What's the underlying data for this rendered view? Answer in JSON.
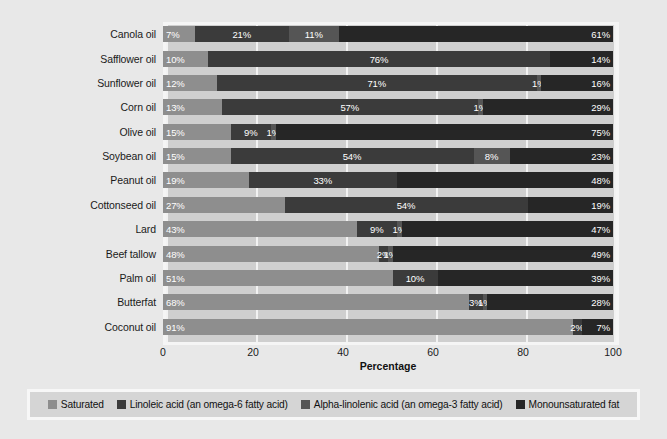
{
  "chart_data": {
    "type": "bar",
    "orientation": "horizontal",
    "stacked": true,
    "title": "",
    "xlabel": "Percentage",
    "ylabel": "",
    "xlim": [
      0,
      100
    ],
    "xticks": [
      0,
      20,
      40,
      60,
      80,
      100
    ],
    "xtick_labels": [
      "0",
      "20",
      "40",
      "60",
      "80",
      "100"
    ],
    "grid": true,
    "legend_position": "bottom",
    "categories": [
      "Canola oil",
      "Safflower oil",
      "Sunflower oil",
      "Corn oil",
      "Olive oil",
      "Soybean oil",
      "Peanut oil",
      "Cottonseed oil",
      "Lard",
      "Beef tallow",
      "Palm oil",
      "Butterfat",
      "Coconut oil"
    ],
    "series": [
      {
        "name": "Saturated",
        "color": "#8e8e8e",
        "values": [
          7,
          10,
          12,
          13,
          15,
          15,
          19,
          27,
          43,
          48,
          51,
          68,
          91
        ],
        "labels": [
          "7%",
          "10%",
          "12%",
          "13%",
          "15%",
          "15%",
          "19%",
          "27%",
          "43%",
          "48%",
          "51%",
          "68%",
          "91%"
        ]
      },
      {
        "name": "Linoleic acid (an omega-6 fatty acid)",
        "color": "#3b3b3b",
        "values": [
          21,
          76,
          71,
          57,
          9,
          54,
          33,
          54,
          9,
          2,
          10,
          3,
          2
        ],
        "labels": [
          "21%",
          "76%",
          "71%",
          "57%",
          "9%",
          "54%",
          "33%",
          "54%",
          "9%",
          "2%",
          "10%",
          "3%",
          "2%"
        ]
      },
      {
        "name": "Alpha-linolenic acid (an omega-3 fatty acid)",
        "color": "#555555",
        "values": [
          11,
          0,
          1,
          1,
          1,
          8,
          0,
          0,
          1,
          1,
          0,
          1,
          0
        ],
        "labels": [
          "11%",
          "Trace",
          "1%",
          "1%",
          "1%",
          "8%",
          "Trace",
          "Trace",
          "1%",
          "1%",
          "Trace",
          "1%",
          ""
        ]
      },
      {
        "name": "Monounsaturated fat",
        "color": "#262626",
        "values": [
          61,
          14,
          16,
          29,
          75,
          23,
          48,
          19,
          47,
          49,
          39,
          28,
          7
        ],
        "labels": [
          "61%",
          "14%",
          "16%",
          "29%",
          "75%",
          "23%",
          "48%",
          "19%",
          "47%",
          "49%",
          "39%",
          "28%",
          "7%"
        ]
      }
    ]
  },
  "legend": {
    "items": [
      {
        "label": "Saturated",
        "color": "#8e8e8e"
      },
      {
        "label": "Linoleic acid (an omega-6 fatty acid)",
        "color": "#3b3b3b"
      },
      {
        "label": "Alpha-linolenic acid (an omega-3 fatty acid)",
        "color": "#555555"
      },
      {
        "label": "Monounsaturated fat",
        "color": "#262626"
      }
    ]
  },
  "axis": {
    "x_title": "Percentage",
    "x_tick_labels": [
      "0",
      "20",
      "40",
      "60",
      "80",
      "100"
    ]
  },
  "colors": {
    "figure_background": "#e8e8e8",
    "plot_background": "#cfcfcf",
    "gridline": "#f2f2f2",
    "panel_border": "#f5f5f5",
    "legend_background": "#d5d5d5",
    "text": "#1a1a1a"
  }
}
